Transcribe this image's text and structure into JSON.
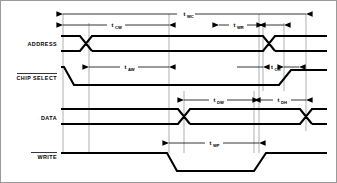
{
  "diagram": {
    "type": "timing-diagram",
    "background_color": "#ffffff",
    "line_color": "#000000",
    "guide_color": "#8d8d8d",
    "signals": [
      {
        "key": "address",
        "label": "ADDRESS",
        "overline": false
      },
      {
        "key": "chip_select",
        "label": "CHIP SELECT",
        "overline": true
      },
      {
        "key": "data",
        "label": "DATA",
        "overline": false
      },
      {
        "key": "write",
        "label": "WRITE",
        "overline": true
      }
    ],
    "timing_parameters": [
      {
        "key": "twc",
        "base": "t",
        "sub": "WC",
        "label": "tWC",
        "row": "top",
        "from": 62,
        "to": 305,
        "arrows": "both"
      },
      {
        "key": "tcw",
        "base": "t",
        "sub": "CW",
        "label": "tCW",
        "row": "address",
        "from": 62,
        "to": 168,
        "arrows": "both"
      },
      {
        "key": "twr",
        "base": "t",
        "sub": "WR",
        "label": "tWR",
        "row": "address",
        "from": 218,
        "to": 258,
        "arrows": "both"
      },
      {
        "key": "tch",
        "base": "t",
        "sub": "CH",
        "label": "tCH",
        "row": "chipselect",
        "from": 262,
        "to": 283,
        "arrows": "both"
      },
      {
        "key": "taw",
        "base": "t",
        "sub": "AW",
        "label": "tAW",
        "row": "chipselect",
        "from": 88,
        "to": 168,
        "arrows": "both"
      },
      {
        "key": "tdw",
        "base": "t",
        "sub": "DW",
        "label": "tDW",
        "row": "data",
        "from": 183,
        "to": 253,
        "arrows": "both"
      },
      {
        "key": "tdh",
        "base": "t",
        "sub": "DH",
        "label": "tDH",
        "row": "data",
        "from": 253,
        "to": 305,
        "arrows": "both"
      },
      {
        "key": "twp",
        "base": "t",
        "sub": "WP",
        "label": "tWP",
        "row": "write",
        "from": 168,
        "to": 258,
        "arrows": "both"
      }
    ],
    "guide_lines": [
      62,
      88,
      168,
      183,
      253,
      258,
      262,
      283,
      305
    ],
    "waveform_events": {
      "address": {
        "transitions": [
          85,
          268
        ],
        "state": "valid-between"
      },
      "chip_select": {
        "fall": 63,
        "fall_end": 72,
        "rise": 278,
        "rise_end": 290,
        "active_low": true
      },
      "data": {
        "transitions": [
          183,
          305
        ],
        "state": "valid-between"
      },
      "write": {
        "fall": 166,
        "fall_end": 176,
        "rise": 253,
        "rise_end": 265,
        "active_low": true
      }
    }
  }
}
